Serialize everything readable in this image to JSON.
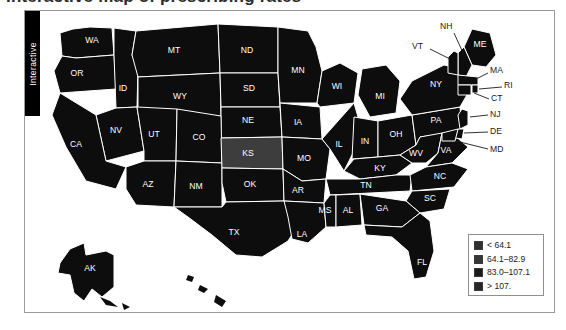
{
  "page": {
    "cropped_heading": "Interactive map of prescribing rates"
  },
  "sidebar_tab": {
    "label": "Interactive",
    "background": "#000000",
    "text_color": "#ffffff"
  },
  "map": {
    "fill_dark": "#0d0d0d",
    "fill_mid": "#2a2a2a",
    "fill_light": "#3d3d3d",
    "border_color": "#ffffff",
    "background": "#ffffff",
    "states": [
      {
        "code": "WA",
        "x": 52,
        "y": 30
      },
      {
        "code": "OR",
        "x": 37,
        "y": 63
      },
      {
        "code": "ID",
        "x": 79,
        "y": 78
      },
      {
        "code": "MT",
        "x": 134,
        "y": 40
      },
      {
        "code": "ND",
        "x": 207,
        "y": 47
      },
      {
        "code": "SD",
        "x": 209,
        "y": 78
      },
      {
        "code": "MN",
        "x": 256,
        "y": 60
      },
      {
        "code": "WI",
        "x": 297,
        "y": 79
      },
      {
        "code": "MI",
        "x": 339,
        "y": 90
      },
      {
        "code": "WY",
        "x": 140,
        "y": 90
      },
      {
        "code": "NV",
        "x": 69,
        "y": 117
      },
      {
        "code": "UT",
        "x": 108,
        "y": 125
      },
      {
        "code": "CO",
        "x": 159,
        "y": 131
      },
      {
        "code": "NE",
        "x": 205,
        "y": 110
      },
      {
        "code": "IA",
        "x": 248,
        "y": 112
      },
      {
        "code": "IL",
        "x": 295,
        "y": 125
      },
      {
        "code": "IN",
        "x": 325,
        "y": 128
      },
      {
        "code": "OH",
        "x": 357,
        "y": 120
      },
      {
        "code": "PA",
        "x": 395,
        "y": 104
      },
      {
        "code": "CA",
        "x": 26,
        "y": 138
      },
      {
        "code": "KS",
        "x": 206,
        "y": 143
      },
      {
        "code": "MO",
        "x": 250,
        "y": 146
      },
      {
        "code": "KY",
        "x": 340,
        "y": 152
      },
      {
        "code": "WV",
        "x": 374,
        "y": 141
      },
      {
        "code": "VA",
        "x": 402,
        "y": 146
      },
      {
        "code": "AZ",
        "x": 104,
        "y": 173
      },
      {
        "code": "NM",
        "x": 151,
        "y": 174
      },
      {
        "code": "OK",
        "x": 207,
        "y": 175
      },
      {
        "code": "AR",
        "x": 252,
        "y": 178
      },
      {
        "code": "TN",
        "x": 330,
        "y": 172
      },
      {
        "code": "NC",
        "x": 400,
        "y": 166
      },
      {
        "code": "SC",
        "x": 390,
        "y": 187
      },
      {
        "code": "MS",
        "x": 277,
        "y": 197
      },
      {
        "code": "AL",
        "x": 307,
        "y": 197
      },
      {
        "code": "GA",
        "x": 340,
        "y": 195
      },
      {
        "code": "TX",
        "x": 180,
        "y": 219
      },
      {
        "code": "LA",
        "x": 257,
        "y": 222
      },
      {
        "code": "FL",
        "x": 383,
        "y": 249
      },
      {
        "code": "AK",
        "x": 52,
        "y": 258
      }
    ],
    "callouts": [
      {
        "code": "NH",
        "label_x": 408,
        "label_y": 12,
        "line": "418,18 L 430,52"
      },
      {
        "code": "VT",
        "label_x": 380,
        "label_y": 34,
        "line": "394,36 L 422,52"
      },
      {
        "code": "ME",
        "label_x": 440,
        "label_y": 32
      },
      {
        "code": "NY",
        "label_x": 400,
        "label_y": 68
      },
      {
        "code": "MA",
        "label_x": 452,
        "label_y": 62,
        "line": "450,63 L 432,69"
      },
      {
        "code": "RI",
        "label_x": 464,
        "label_y": 76,
        "line": "462,77 L 434,75"
      },
      {
        "code": "CT",
        "label_x": 452,
        "label_y": 89,
        "line": "450,88 L 430,79"
      },
      {
        "code": "NJ",
        "label_x": 452,
        "label_y": 105,
        "line": "450,105 L 424,104"
      },
      {
        "code": "DE",
        "label_x": 452,
        "label_y": 122,
        "line": "450,122 L 419,121"
      },
      {
        "code": "MD",
        "label_x": 452,
        "label_y": 139,
        "line": "450,138 L 416,127"
      }
    ]
  },
  "legend": {
    "items": [
      {
        "label": "< 64.1",
        "color": "#2e2e2e"
      },
      {
        "label": "64.1–82.9",
        "color": "#363636"
      },
      {
        "label": "83.0–107.1",
        "color": "#1a1a1a"
      },
      {
        "label": "> 107.",
        "color": "#262626"
      }
    ]
  }
}
